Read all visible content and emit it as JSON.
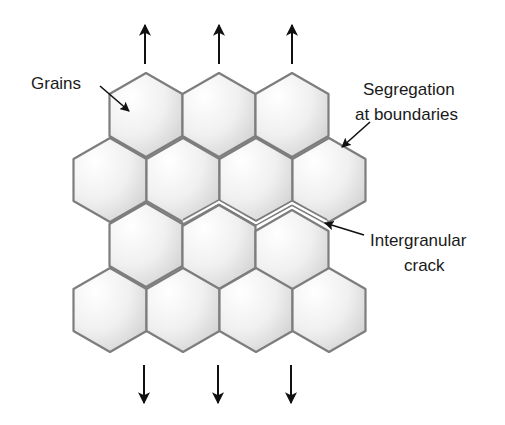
{
  "diagram": {
    "colors": {
      "background": "#ffffff",
      "grain_stroke": "#7d7d7d",
      "grain_fill_light": "#ffffff",
      "grain_fill_dark": "#d2d2d2",
      "arrow": "#111111",
      "text": "#1a1a1a"
    },
    "hex": {
      "half_width": 36.5,
      "shoulder": 21,
      "side": 42
    },
    "grains": [
      {
        "row": 1,
        "cx": 146,
        "top": 73
      },
      {
        "row": 1,
        "cx": 219,
        "top": 73
      },
      {
        "row": 1,
        "cx": 292,
        "top": 73
      },
      {
        "row": 2,
        "cx": 110,
        "top": 138
      },
      {
        "row": 2,
        "cx": 183,
        "top": 138
      },
      {
        "row": 2,
        "cx": 256,
        "top": 138
      },
      {
        "row": 2,
        "cx": 329,
        "top": 138
      },
      {
        "row": 3,
        "cx": 146,
        "top": 203
      },
      {
        "row": 3,
        "cx": 219,
        "top": 205
      },
      {
        "row": 3,
        "cx": 292,
        "top": 210
      },
      {
        "row": 4,
        "cx": 110,
        "top": 268
      },
      {
        "row": 4,
        "cx": 183,
        "top": 268
      },
      {
        "row": 4,
        "cx": 256,
        "top": 268
      },
      {
        "row": 4,
        "cx": 329,
        "top": 268
      }
    ],
    "crack_path": [
      [
        183,
        222
      ],
      [
        219,
        202
      ],
      [
        256,
        223
      ],
      [
        292,
        203
      ],
      [
        327,
        222
      ]
    ],
    "stress_arrows": {
      "up": [
        {
          "x": 145,
          "y_start": 64,
          "y_tip": 25
        },
        {
          "x": 219,
          "y_start": 64,
          "y_tip": 25
        },
        {
          "x": 292,
          "y_start": 64,
          "y_tip": 25
        }
      ],
      "down": [
        {
          "x": 144,
          "y_start": 365,
          "y_tip": 403
        },
        {
          "x": 218,
          "y_start": 365,
          "y_tip": 403
        },
        {
          "x": 291,
          "y_start": 365,
          "y_tip": 403
        }
      ]
    },
    "labels": {
      "grains": {
        "text": "Grains",
        "x": 31,
        "y": 74
      },
      "segregation_line1": {
        "text": "Segregation",
        "x": 363,
        "y": 80
      },
      "segregation_line2": {
        "text": "at boundaries",
        "x": 355,
        "y": 105
      },
      "crack_line1": {
        "text": "Intergranular",
        "x": 370,
        "y": 231
      },
      "crack_line2": {
        "text": "crack",
        "x": 404,
        "y": 256
      }
    },
    "leader_arrows": [
      {
        "name": "grains-leader",
        "from": [
          100,
          86
        ],
        "to": [
          129,
          111
        ]
      },
      {
        "name": "segregation-leader",
        "from": [
          370,
          122
        ],
        "to": [
          342,
          147
        ]
      },
      {
        "name": "crack-leader",
        "from": [
          364,
          235
        ],
        "to": [
          325,
          223
        ]
      }
    ]
  }
}
